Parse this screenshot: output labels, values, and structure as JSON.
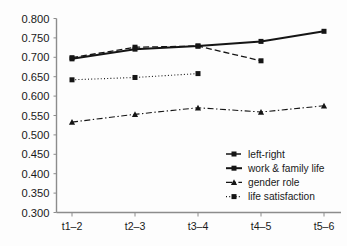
{
  "chart_data": {
    "type": "line",
    "title": "",
    "xlabel": "",
    "ylabel": "",
    "categories": [
      "t1–2",
      "t2–3",
      "t3–4",
      "t4–5",
      "t5–6"
    ],
    "ylim": [
      0.3,
      0.8
    ],
    "yticks": [
      "0.300",
      "0.350",
      "0.400",
      "0.450",
      "0.500",
      "0.550",
      "0.600",
      "0.650",
      "0.700",
      "0.750",
      "0.800"
    ],
    "ytick_values": [
      0.3,
      0.35,
      0.4,
      0.45,
      0.5,
      0.55,
      0.6,
      0.65,
      0.7,
      0.75,
      0.8
    ],
    "grid": false,
    "legend_position": "center-right",
    "series": [
      {
        "name": "left-right",
        "values": [
          0.699,
          0.726,
          0.729,
          0.691,
          null
        ],
        "line_style": "dashed",
        "marker": "square",
        "color": "#151515"
      },
      {
        "name": "work & family life",
        "values": [
          0.696,
          0.721,
          0.729,
          0.741,
          0.767
        ],
        "line_style": "solid",
        "marker": "square",
        "color": "#151515"
      },
      {
        "name": "gender role",
        "values": [
          0.533,
          0.553,
          0.57,
          0.559,
          0.575
        ],
        "line_style": "dashdot",
        "marker": "triangle",
        "color": "#151515"
      },
      {
        "name": "life satisfaction",
        "values": [
          0.642,
          0.648,
          0.658,
          null,
          null
        ],
        "line_style": "dotted",
        "marker": "square",
        "color": "#151515"
      }
    ]
  },
  "legend": {
    "entries": [
      {
        "label": "left-right"
      },
      {
        "label": "work & family life"
      },
      {
        "label": "gender role"
      },
      {
        "label": "life satisfaction"
      }
    ]
  },
  "colors": {
    "background": "#fdfdfd",
    "axis": "#8c8c8c",
    "ink": "#151515",
    "text": "#1a1a1a"
  }
}
